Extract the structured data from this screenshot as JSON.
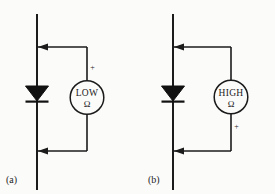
{
  "figure": {
    "background_color": "#fbfbfa",
    "line_color": "#1b1b1b",
    "panels": [
      {
        "caption": "(a)",
        "meter": {
          "reading_label": "LOW",
          "unit_symbol": "Ω",
          "polarity_marker": "+",
          "polarity_position": "top"
        },
        "component": "diode",
        "lead_arrow_direction": "left"
      },
      {
        "caption": "(b)",
        "meter": {
          "reading_label": "HIGH",
          "unit_symbol": "Ω",
          "polarity_marker": "+",
          "polarity_position": "bottom"
        },
        "component": "diode",
        "lead_arrow_direction": "left"
      }
    ]
  }
}
